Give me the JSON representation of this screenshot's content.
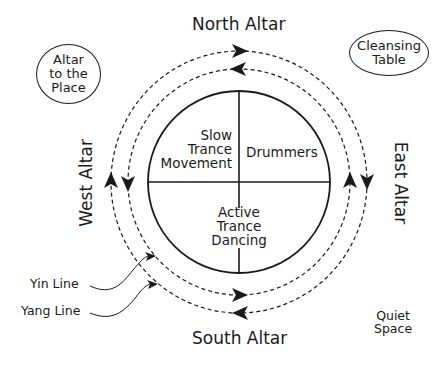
{
  "diagram": {
    "title": "",
    "altars": {
      "north": "North Altar",
      "south": "South Altar",
      "east": "East Altar",
      "west": "West Altar"
    },
    "corner_labels": {
      "altar_to_place": [
        "Altar",
        "to the",
        "Place"
      ],
      "cleansing_table": [
        "Cleansing",
        "Table"
      ],
      "quiet_space": [
        "Quiet",
        "Space"
      ]
    },
    "quadrants": {
      "top_left": [
        "Slow",
        "Trance",
        "Movement"
      ],
      "top_right": [
        "Drummers"
      ],
      "bottom": [
        "Active",
        "Trance",
        "Dancing"
      ]
    },
    "lines": {
      "yin": "Yin Line",
      "yang": "Yang Line"
    },
    "arrows": {
      "outer_circle_direction": "clockwise",
      "inner_circle_direction": "counterclockwise"
    }
  }
}
